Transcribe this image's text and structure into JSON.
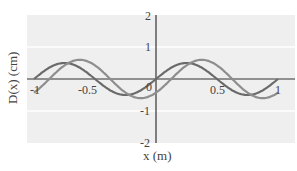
{
  "chart_data": {
    "type": "line",
    "title": "",
    "xlabel": "x (m)",
    "ylabel": "D(x) (cm)",
    "xlim": [
      -1,
      1
    ],
    "ylim": [
      -2,
      2
    ],
    "xticks": [
      "-1",
      "-0.5",
      "0",
      "0.5",
      "1"
    ],
    "yticks": [
      "2",
      "1",
      "-1",
      "-2"
    ],
    "grid": true,
    "series": [
      {
        "name": "wave-dark",
        "color": "#6a6a6a",
        "amplitude": 0.5,
        "wavelength": 1.0,
        "phase_shift": 0.0,
        "x": [
          -1,
          -0.75,
          -0.5,
          -0.25,
          0,
          0.25,
          0.5,
          0.75,
          1
        ],
        "values": [
          0,
          0.5,
          0,
          -0.5,
          0,
          0.5,
          0,
          -0.5,
          0
        ]
      },
      {
        "name": "wave-light",
        "color": "#8e8e8e",
        "amplitude": 0.6,
        "wavelength": 1.0,
        "phase_shift": 0.125,
        "x": [
          -1,
          -0.875,
          -0.625,
          -0.375,
          -0.125,
          0.125,
          0.375,
          0.625,
          0.875,
          1
        ],
        "values": [
          -0.42,
          0,
          0.6,
          0,
          -0.6,
          0,
          0.6,
          0,
          -0.6,
          -0.42
        ]
      }
    ]
  }
}
